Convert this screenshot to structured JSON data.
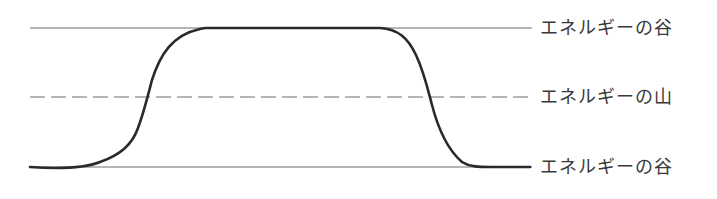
{
  "diagram": {
    "title": "",
    "labels": {
      "top": "エネルギーの谷",
      "middle": "エネルギーの山",
      "bottom": "エネルギーの谷"
    },
    "reference_lines": [
      {
        "name": "top-valley-line",
        "y": 28,
        "style": "solid"
      },
      {
        "name": "peak-line",
        "y": 97,
        "style": "dashed"
      },
      {
        "name": "bottom-valley-line",
        "y": 167,
        "style": "solid"
      }
    ],
    "colors": {
      "line": "#6e6e6e",
      "curve": "#2a2a2a",
      "text": "#3a3a3a"
    }
  }
}
